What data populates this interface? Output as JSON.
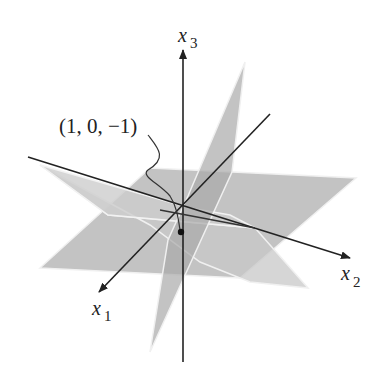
{
  "figure": {
    "axes": {
      "x1": {
        "label": "x",
        "subscript": "1"
      },
      "x2": {
        "label": "x",
        "subscript": "2"
      },
      "x3": {
        "label": "x",
        "subscript": "3"
      }
    },
    "point": {
      "label": "(1, 0, −1)"
    },
    "colors": {
      "plane_fill": "#b8b8b8",
      "plane_fill_light": "#cfcfcf",
      "plane_edge": "#eeeeee",
      "axis": "#222222"
    }
  }
}
